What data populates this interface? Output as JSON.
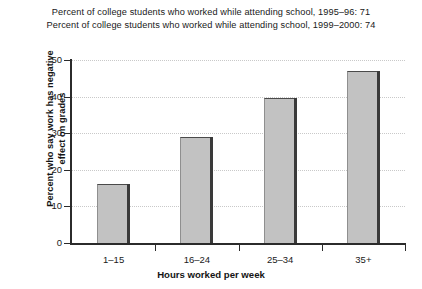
{
  "chart_data": {
    "type": "bar",
    "title": "Percent of college students who worked while attending school, 1995–96: 71\nPercent of college students who worked while attending school, 1999–2000: 74",
    "title_lines": [
      "Percent of college students who worked while attending school, 1995–96: 71",
      "Percent of college students who worked while attending school, 1999–2000: 74"
    ],
    "categories": [
      "1–15",
      "16–24",
      "25–34",
      "35+"
    ],
    "values": [
      16,
      29,
      39.5,
      47
    ],
    "xlabel": "Hours worked per week",
    "ylabel": "Percent who say work has negative effect on grades",
    "ylabel_lines": [
      "Percent who say work has negative",
      "effect on grades"
    ],
    "ylim": [
      0,
      50
    ],
    "ytick_labels": [
      "0",
      "10",
      "20",
      "30",
      "40",
      "50"
    ],
    "ytick_values": [
      0,
      10,
      20,
      30,
      40,
      50
    ],
    "grid": true,
    "legend": "none",
    "colors": {
      "bar_fill": "#c2c2c2",
      "bar_edge": "#4a4a4a",
      "bar_shadow": "#3a3a3a",
      "axis": "#2b2b2b",
      "grid": "#c9c9c9",
      "background": "#ffffff",
      "text": "#1a1a1a"
    }
  }
}
